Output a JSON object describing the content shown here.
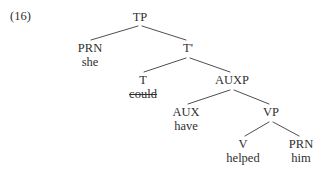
{
  "figure": {
    "example_number": "(16)",
    "sentence_words": [
      "she",
      "could",
      "have",
      "helped",
      "him"
    ],
    "nodes": [
      {
        "id": "TP",
        "label": "TP",
        "word": "",
        "struck": false,
        "x": 140,
        "y": 11
      },
      {
        "id": "PRN1",
        "label": "PRN",
        "word": "she",
        "struck": false,
        "x": 90,
        "y": 42
      },
      {
        "id": "Tbar",
        "label": "T'",
        "word": "",
        "struck": false,
        "x": 188,
        "y": 42
      },
      {
        "id": "T",
        "label": "T",
        "word": "could",
        "struck": true,
        "x": 143,
        "y": 74
      },
      {
        "id": "AUXP",
        "label": "AUXP",
        "word": "",
        "struck": false,
        "x": 232,
        "y": 74
      },
      {
        "id": "AUX",
        "label": "AUX",
        "word": "have",
        "struck": false,
        "x": 186,
        "y": 106
      },
      {
        "id": "VP",
        "label": "VP",
        "word": "",
        "struck": false,
        "x": 271,
        "y": 106
      },
      {
        "id": "V",
        "label": "V",
        "word": "helped",
        "struck": false,
        "x": 243,
        "y": 138
      },
      {
        "id": "PRN2",
        "label": "PRN",
        "word": "him",
        "struck": false,
        "x": 301,
        "y": 138
      }
    ],
    "branches": [
      {
        "from": "TP",
        "to": "PRN1",
        "x1": 138,
        "y1": 26,
        "x2": 91,
        "y2": 40
      },
      {
        "from": "TP",
        "to": "Tbar",
        "x1": 142,
        "y1": 26,
        "x2": 186,
        "y2": 40
      },
      {
        "from": "Tbar",
        "to": "T",
        "x1": 186,
        "y1": 58,
        "x2": 144,
        "y2": 72
      },
      {
        "from": "Tbar",
        "to": "AUXP",
        "x1": 190,
        "y1": 58,
        "x2": 230,
        "y2": 72
      },
      {
        "from": "AUXP",
        "to": "AUX",
        "x1": 230,
        "y1": 90,
        "x2": 188,
        "y2": 104
      },
      {
        "from": "AUXP",
        "to": "VP",
        "x1": 234,
        "y1": 90,
        "x2": 269,
        "y2": 104
      },
      {
        "from": "VP",
        "to": "V",
        "x1": 269,
        "y1": 122,
        "x2": 245,
        "y2": 136
      },
      {
        "from": "VP",
        "to": "PRN2",
        "x1": 273,
        "y1": 122,
        "x2": 299,
        "y2": 136
      }
    ],
    "colors": {
      "background": "#ffffff",
      "text": "#2f2f2f",
      "line": "#3a3a3a"
    }
  }
}
